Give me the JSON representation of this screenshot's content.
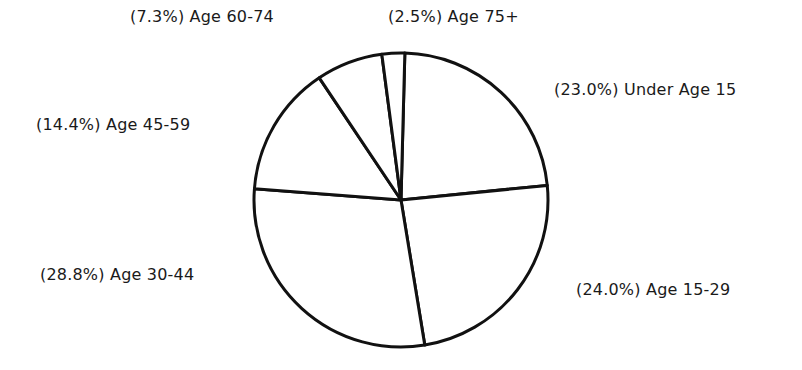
{
  "chart_data": {
    "type": "pie",
    "title": "",
    "start_angle_deg": 1.5,
    "direction": "clockwise",
    "slices": [
      {
        "label": "Under Age 15",
        "value": 23.0,
        "display": "(23.0%) Under Age 15"
      },
      {
        "label": "Age 15-29",
        "value": 24.0,
        "display": "(24.0%) Age 15-29"
      },
      {
        "label": "Age 30-44",
        "value": 28.8,
        "display": "(28.8%) Age 30-44"
      },
      {
        "label": "Age 45-59",
        "value": 14.4,
        "display": "(14.4%) Age 45-59"
      },
      {
        "label": "Age 60-74",
        "value": 7.3,
        "display": "(7.3%) Age 60-74"
      },
      {
        "label": "Age 75+",
        "value": 2.5,
        "display": "(2.5%) Age 75+"
      }
    ],
    "fill_color": "#ffffff",
    "stroke_color": "#111111"
  },
  "labels": {
    "under15": "(23.0%) Under Age 15",
    "a15_29": "(24.0%) Age 15-29",
    "a30_44": "(28.8%) Age 30-44",
    "a45_59": "(14.4%) Age 45-59",
    "a60_74": "(7.3%) Age 60-74",
    "a75": "(2.5%) Age 75+"
  }
}
